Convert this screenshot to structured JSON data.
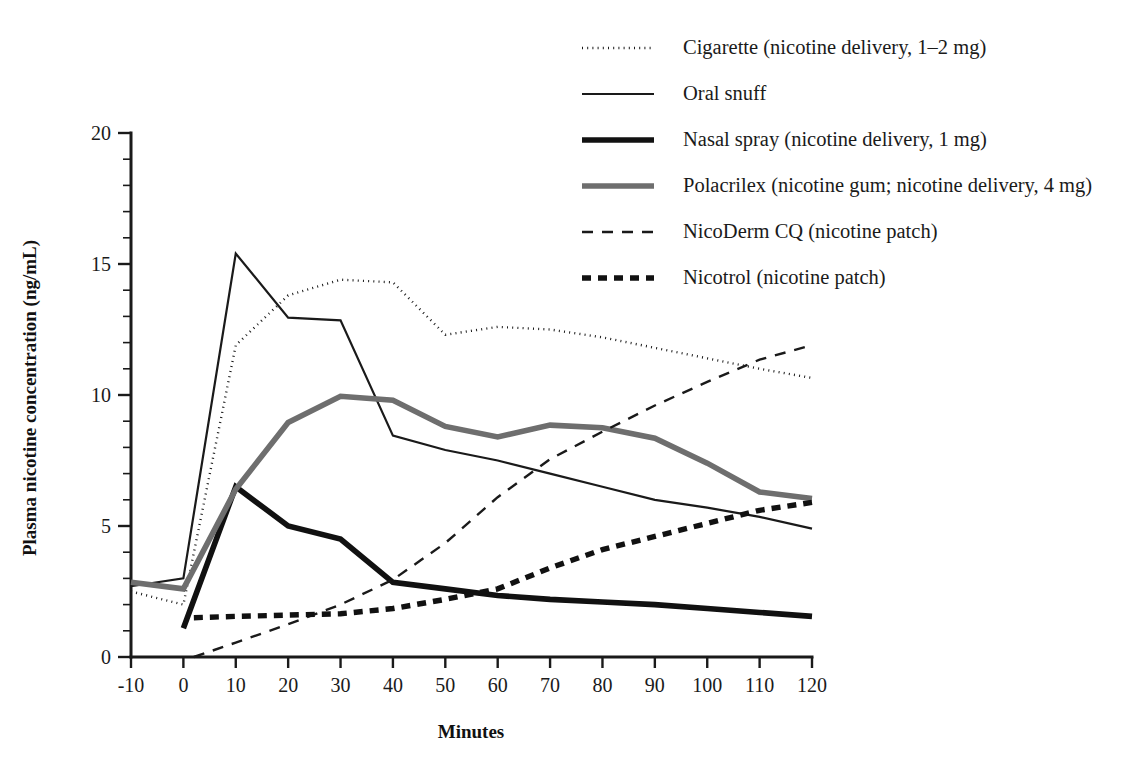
{
  "chart_data": {
    "type": "line",
    "title": "",
    "subtitle": "",
    "xlabel": "Minutes",
    "ylabel": "Plasma nicotine concentration (ng/mL)",
    "xlim": [
      -10,
      120
    ],
    "ylim": [
      0,
      20
    ],
    "xticks": [
      -10,
      0,
      10,
      20,
      30,
      40,
      50,
      60,
      70,
      80,
      90,
      100,
      110,
      120
    ],
    "xtick_labels": [
      "-10",
      "0",
      "10",
      "20",
      "30",
      "40",
      "50",
      "60",
      "70",
      "80",
      "90",
      "100",
      "110",
      "120"
    ],
    "yticks": [
      0,
      5,
      10,
      15,
      20
    ],
    "ytick_labels": [
      "0",
      "5",
      "10",
      "15",
      "20"
    ],
    "y_minor_tick_step": 1,
    "grid": false,
    "legend_position": "top-center",
    "series": [
      {
        "name": "cigarette",
        "label": "Cigarette (nicotine delivery, 1–2 mg)",
        "style": "dotted",
        "color": "#1a1a1a",
        "width": 2.4,
        "dash": "1,4.2",
        "x": [
          -10,
          0,
          10,
          20,
          30,
          40,
          50,
          60,
          70,
          80,
          90,
          100,
          110,
          120
        ],
        "y": [
          2.5,
          2.0,
          11.9,
          13.8,
          14.4,
          14.3,
          12.3,
          12.6,
          12.5,
          12.2,
          11.8,
          11.4,
          11.0,
          10.65
        ]
      },
      {
        "name": "oral-snuff",
        "label": "Oral snuff",
        "style": "solid-thin",
        "color": "#1a1a1a",
        "width": 2.2,
        "dash": "",
        "x": [
          -10,
          0,
          10,
          20,
          30,
          40,
          50,
          60,
          70,
          80,
          90,
          100,
          110,
          120
        ],
        "y": [
          2.7,
          3.0,
          15.4,
          12.95,
          12.85,
          8.45,
          7.9,
          7.5,
          7.0,
          6.5,
          6.0,
          5.7,
          5.35,
          4.9
        ]
      },
      {
        "name": "nasal-spray",
        "label": "Nasal spray (nicotine delivery, 1 mg)",
        "style": "solid-thick-black",
        "color": "#111111",
        "width": 5.6,
        "dash": "",
        "x": [
          0,
          10,
          20,
          30,
          40,
          50,
          60,
          70,
          80,
          90,
          100,
          110,
          120
        ],
        "y": [
          1.1,
          6.5,
          5.0,
          4.5,
          2.85,
          2.6,
          2.35,
          2.2,
          2.1,
          2.0,
          1.85,
          1.7,
          1.55
        ]
      },
      {
        "name": "polacrilex",
        "label": "Polacrilex (nicotine gum; nicotine delivery, 4 mg)",
        "style": "solid-thick-gray",
        "color": "#6e6e6e",
        "width": 5.6,
        "dash": "",
        "x": [
          -10,
          0,
          10,
          20,
          30,
          40,
          50,
          60,
          70,
          80,
          90,
          100,
          110,
          120
        ],
        "y": [
          2.85,
          2.6,
          6.4,
          8.95,
          9.95,
          9.8,
          8.8,
          8.4,
          8.85,
          8.75,
          8.35,
          7.4,
          6.3,
          6.05
        ]
      },
      {
        "name": "nicoderm-cq",
        "label": "NicoDerm CQ (nicotine patch)",
        "style": "dashed",
        "color": "#1a1a1a",
        "width": 2.4,
        "dash": "11,9",
        "x": [
          2,
          10,
          20,
          30,
          40,
          50,
          60,
          70,
          80,
          90,
          100,
          110,
          120
        ],
        "y": [
          0.0,
          0.55,
          1.25,
          2.0,
          2.95,
          4.35,
          6.1,
          7.55,
          8.6,
          9.6,
          10.5,
          11.35,
          11.9
        ]
      },
      {
        "name": "nicotrol",
        "label": "Nicotrol (nicotine patch)",
        "style": "dashed-thick",
        "color": "#111111",
        "width": 5.4,
        "dash": "9,7",
        "x": [
          2,
          10,
          20,
          30,
          40,
          50,
          60,
          70,
          80,
          90,
          100,
          110,
          120
        ],
        "y": [
          1.5,
          1.55,
          1.6,
          1.65,
          1.85,
          2.2,
          2.6,
          3.4,
          4.1,
          4.6,
          5.1,
          5.6,
          5.9
        ]
      }
    ]
  },
  "legend": {
    "items": [
      {
        "label": "Cigarette (nicotine delivery, 1–2 mg)",
        "series": "cigarette"
      },
      {
        "label": "Oral snuff",
        "series": "oral-snuff"
      },
      {
        "label": "Nasal spray (nicotine delivery, 1 mg)",
        "series": "nasal-spray"
      },
      {
        "label": "Polacrilex (nicotine gum; nicotine delivery, 4 mg)",
        "series": "polacrilex"
      },
      {
        "label": "NicoDerm CQ (nicotine patch)",
        "series": "nicoderm-cq"
      },
      {
        "label": "Nicotrol (nicotine patch)",
        "series": "nicotrol"
      }
    ]
  },
  "axes": {
    "x_title": "Minutes",
    "y_title": "Plasma nicotine concentration (ng/mL)"
  }
}
